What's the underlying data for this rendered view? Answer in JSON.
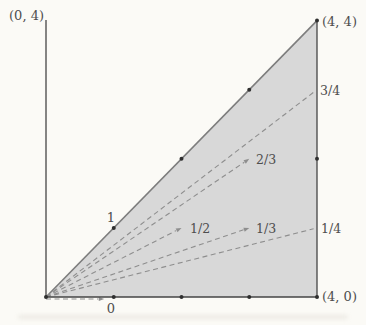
{
  "figure": {
    "colors": {
      "background": "#fbfaf6",
      "triangle_fill": "#d8d8d8",
      "axis": "#454545",
      "diagonal": "#7d7d7d",
      "dash": "#8e8e8e",
      "dot": "#2f2f2f",
      "text": "#4e4e4e"
    },
    "geometry": {
      "canvas_w": 366,
      "canvas_h": 325,
      "origin_px": [
        46,
        297
      ],
      "unit_px_x": 67.75,
      "unit_px_y": 69.1,
      "y_axis_top_px": 20,
      "apex_px_y": 20.5
    },
    "axes": [
      {
        "name": "y-axis",
        "from_px": [
          46,
          20
        ],
        "to_px": [
          46,
          297
        ]
      },
      {
        "name": "x-axis",
        "from_px": [
          46,
          297
        ],
        "to_px": [
          317,
          297
        ]
      },
      {
        "name": "right-edge",
        "from_px": [
          317,
          20.5
        ],
        "to_px": [
          317,
          297
        ]
      }
    ],
    "rays": [
      {
        "name": "ray-slope-1",
        "slope": "1",
        "style": "solid",
        "to_units": [
          4,
          4
        ],
        "arrow": false
      },
      {
        "name": "ray-slope-3-4",
        "slope": "3/4",
        "style": "dashed",
        "to_units": [
          3.95,
          2.9625
        ],
        "arrow": false
      },
      {
        "name": "ray-slope-2-3",
        "slope": "2/3",
        "style": "dashed",
        "to_units": [
          3,
          2
        ],
        "arrow": true
      },
      {
        "name": "ray-slope-1-2",
        "slope": "1/2",
        "style": "dashed",
        "to_units": [
          2,
          1
        ],
        "arrow": true
      },
      {
        "name": "ray-slope-1-3",
        "slope": "1/3",
        "style": "dashed",
        "to_units": [
          3,
          1
        ],
        "arrow": true
      },
      {
        "name": "ray-slope-1-4",
        "slope": "1/4",
        "style": "dashed",
        "to_units": [
          3.95,
          0.9875
        ],
        "arrow": false
      },
      {
        "name": "ray-slope-0",
        "slope": "0",
        "style": "dashed",
        "to_units": [
          0.86,
          0
        ],
        "arrow": true,
        "offset_px": [
          0,
          2
        ]
      }
    ],
    "dots_units": [
      [
        0,
        0
      ],
      [
        1,
        0
      ],
      [
        2,
        0
      ],
      [
        3,
        0
      ],
      [
        4,
        0
      ],
      [
        1,
        1
      ],
      [
        2,
        2
      ],
      [
        3,
        3
      ],
      [
        4,
        4
      ],
      [
        4,
        2
      ]
    ],
    "labels": [
      {
        "name": "label-vertex-0-4",
        "text": "(0, 4)",
        "x": 44,
        "y": 20,
        "anchor": "end",
        "size": 13
      },
      {
        "name": "label-vertex-4-4",
        "text": "(4, 4)",
        "x": 322,
        "y": 26,
        "anchor": "start",
        "size": 13
      },
      {
        "name": "label-vertex-4-0",
        "text": "(4, 0)",
        "x": 322,
        "y": 301,
        "anchor": "start",
        "size": 13
      },
      {
        "name": "label-slope-1",
        "text": "1",
        "x": 111,
        "y": 222,
        "anchor": "middle",
        "size": 13
      },
      {
        "name": "label-slope-3-4",
        "text": "3/4",
        "x": 320,
        "y": 95,
        "anchor": "start",
        "size": 12.5
      },
      {
        "name": "label-slope-2-3",
        "text": "2/3",
        "x": 256,
        "y": 164,
        "anchor": "start",
        "size": 12.5
      },
      {
        "name": "label-slope-1-2",
        "text": "1/2",
        "x": 190,
        "y": 233,
        "anchor": "start",
        "size": 12.5
      },
      {
        "name": "label-slope-1-3",
        "text": "1/3",
        "x": 256,
        "y": 233,
        "anchor": "start",
        "size": 12.5
      },
      {
        "name": "label-slope-1-4",
        "text": "1/4",
        "x": 321,
        "y": 233,
        "anchor": "start",
        "size": 12.5
      },
      {
        "name": "label-slope-0",
        "text": "0",
        "x": 111,
        "y": 313,
        "anchor": "middle",
        "size": 13
      }
    ]
  }
}
